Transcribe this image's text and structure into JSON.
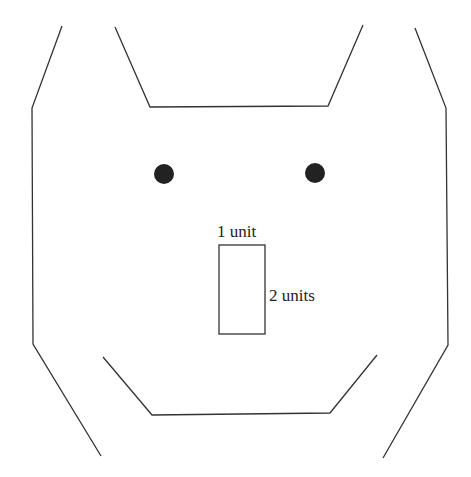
{
  "diagram": {
    "type": "face-outline-drawing",
    "labels": {
      "top": "1 unit",
      "side": "2 units"
    },
    "colors": {
      "line": "#333333",
      "eye": "#222222",
      "background": "#ffffff"
    },
    "shapes": {
      "left_outline": "62,26 32,108 33,344 101,456",
      "right_outline": "415,28 446,108 448,345 383,458",
      "ears_top": "115,27 150,107 328,106 363,25",
      "mouth": "103,357 152,415 330,413 377,355",
      "nose_rect": {
        "x": 219,
        "y": 245,
        "width": 46,
        "height": 89
      },
      "left_eye": {
        "cx": 164,
        "cy": 174,
        "r": 10
      },
      "right_eye": {
        "cx": 315,
        "cy": 173,
        "r": 10
      }
    }
  }
}
